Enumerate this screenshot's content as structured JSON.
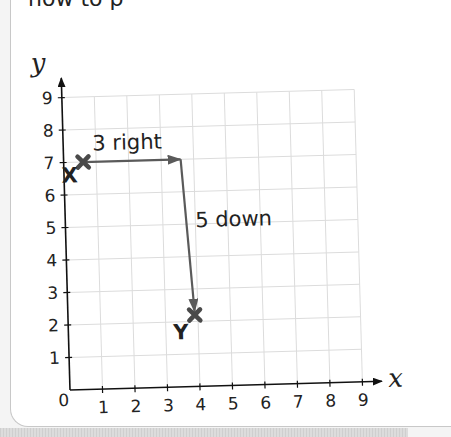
{
  "intro_text": "how to p",
  "chart_data": {
    "type": "scatter",
    "title": "",
    "xlabel": "x",
    "ylabel": "y",
    "xlim": [
      0,
      9
    ],
    "ylim": [
      0,
      9
    ],
    "grid": true,
    "x_ticks": [
      "0",
      "1",
      "2",
      "3",
      "4",
      "5",
      "6",
      "7",
      "8",
      "9"
    ],
    "y_ticks": [
      "1",
      "2",
      "3",
      "4",
      "5",
      "6",
      "7",
      "8",
      "9"
    ],
    "points": [
      {
        "label": "X",
        "x": 0.6,
        "y": 7
      },
      {
        "label": "Y",
        "x": 3.9,
        "y": 2.2
      }
    ],
    "annotations": [
      {
        "text": "3 right",
        "type": "arrow",
        "from": [
          0.6,
          7
        ],
        "to": [
          3.6,
          7
        ]
      },
      {
        "text": "5 down",
        "type": "arrow",
        "from": [
          3.6,
          7
        ],
        "to": [
          3.9,
          2.3
        ]
      }
    ],
    "colors": {
      "marker": "#4a4a4a",
      "arrow": "#5a5a5a",
      "grid": "#dcdcdc",
      "axis": "#111111"
    }
  }
}
